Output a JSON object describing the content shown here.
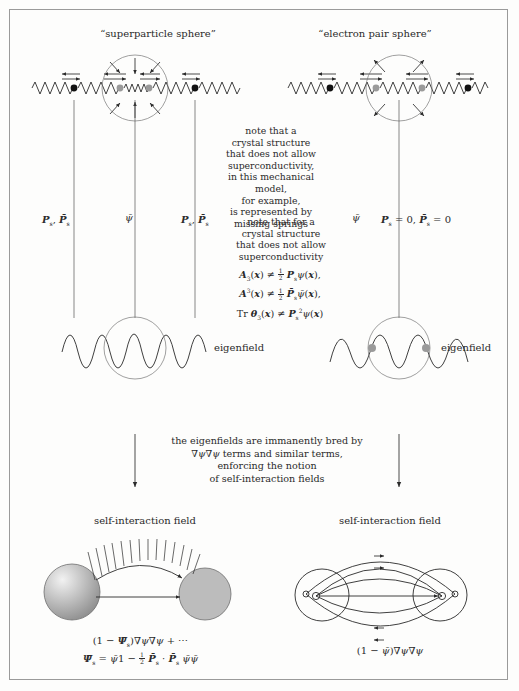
{
  "figure": {
    "top_left_title": "“superparticle sphere”",
    "top_right_title": "“electron pair sphere”",
    "note_right_top": {
      "lines": [
        "note that a",
        "crystal structure",
        "that does not allow",
        "superconductivity,",
        "in this mechanical model,",
        "for example,",
        "is represented by",
        "missing springs"
      ]
    },
    "note_middle": {
      "lines": [
        "note that for a",
        "crystal structure",
        "that does not allow",
        "superconductivity"
      ],
      "equations": [
        "A₃(x) ≠ ½ Pₛψ(x),",
        "A³(x) ≠ ½ Pₛψ̄(x),",
        "Tr θ₃(x) ≠ Pₛ²ψ(x)"
      ]
    },
    "labels": {
      "left_P": "Pₛ, P̄ₛ",
      "left_psi": "ψ̄",
      "left_P2": "Pₛ, P̄ₛ",
      "right_psi": "ψ̄",
      "right_P": "Pₛ = 0, P̄ₛ = 0",
      "eigenfield_left": "eigenfield",
      "eigenfield_right": "eigenfield"
    },
    "transition_note": {
      "lines": [
        "the eigenfields are immanently bred by",
        "∇ψ∇ψ terms and similar terms,",
        "enforcing the notion",
        "of self-interaction fields"
      ]
    },
    "bottom": {
      "left_title": "self-interaction field",
      "right_title": "self-interaction field",
      "left_eq_line1": "(1 − Ψ̄ₛ)∇ψ∇ψ + ⋯",
      "left_eq_line2": "Ψ̄ₛ = ψ̄1 − ½ P̄ₛ · P̄ₛ ψ̄ψ̄",
      "right_eq": "(1 − ψ̄)∇ψ∇ψ"
    },
    "colors": {
      "ink": "#2a2a2a",
      "frame": "#9a9a9a",
      "black_dot": "#111111",
      "gray_dot": "#9a9a9a",
      "background": "#fdfdfc"
    }
  }
}
